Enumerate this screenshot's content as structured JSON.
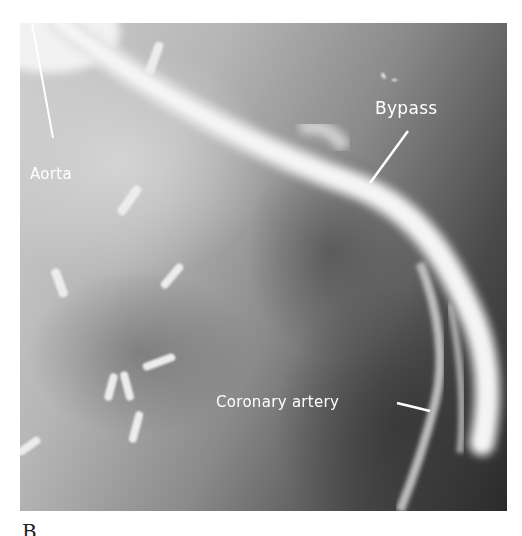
{
  "figure": {
    "panel_label": "B",
    "type": "coronary angiogram (grayscale X-ray)",
    "annotations": [
      {
        "id": "aorta",
        "text": "Aorta"
      },
      {
        "id": "bypass",
        "text": "Bypass"
      },
      {
        "id": "coronary",
        "text": "Coronary artery"
      }
    ],
    "colors": {
      "vessel": "#e8e8e8",
      "background_light": "#c8c8c8",
      "background_dark": "#2a2a2a",
      "label": "#ffffff"
    }
  }
}
